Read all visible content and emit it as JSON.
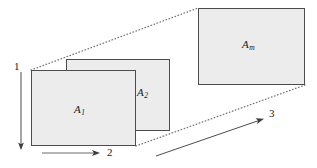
{
  "figure": {
    "title": "",
    "background_color": "#ffffff",
    "line_color": "#4d4d4d",
    "fill_color": "#ececec",
    "text_color": "#1a1a1a"
  },
  "plates": [
    {
      "id": "plate-a1",
      "label": "A",
      "subscript": "1",
      "x": 31,
      "y": 70,
      "width": 105,
      "height": 76,
      "depth_order": "front"
    },
    {
      "id": "plate-a2",
      "label": "A",
      "subscript": "2",
      "x": 66,
      "y": 59,
      "width": 104,
      "height": 72,
      "depth_order": "middle"
    },
    {
      "id": "plate-am",
      "label": "A",
      "subscript": "m",
      "x": 198,
      "y": 8,
      "width": 107,
      "height": 77,
      "depth_order": "back"
    }
  ],
  "projection_lines": [
    {
      "id": "projection-top",
      "from_x": 31,
      "from_y": 70,
      "to_x": 198,
      "to_y": 8
    },
    {
      "id": "projection-bottom",
      "from_x": 136,
      "from_y": 146,
      "to_x": 305,
      "to_y": 85
    }
  ],
  "axes": [
    {
      "id": "axis-1",
      "label": "1",
      "orientation": "vertical-down",
      "from_x": 21,
      "from_y": 72,
      "to_x": 21,
      "to_y": 149
    },
    {
      "id": "axis-2",
      "label": "2",
      "orientation": "horizontal-right",
      "from_x": 42,
      "from_y": 153,
      "to_x": 99,
      "to_y": 153
    },
    {
      "id": "axis-3",
      "label": "3",
      "orientation": "diagonal-up-right",
      "from_x": 156,
      "from_y": 156,
      "to_x": 263,
      "to_y": 119
    }
  ]
}
